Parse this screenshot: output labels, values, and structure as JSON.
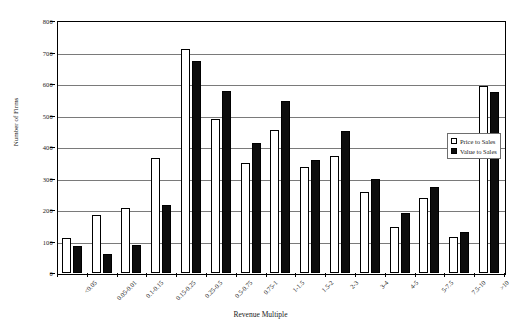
{
  "chart_data": {
    "type": "bar",
    "title": "",
    "xlabel": "Revenue Multiple",
    "ylabel": "Number of Firms",
    "ylim": [
      0,
      800
    ],
    "ytick_step": 100,
    "yticks": [
      "0",
      "100",
      "200",
      "300",
      "400",
      "500",
      "600",
      "700",
      "800"
    ],
    "grid": true,
    "legend_position": "right-middle",
    "categories": [
      "<0.05",
      "0.05-0.01",
      "0.1-0.15",
      "0.15-0.25",
      "0.25-0.5",
      "0.5-0.75",
      "0.75-1",
      "1-1.5",
      "1.5-2",
      "2-3",
      "3-4",
      "4-5",
      "5-7.5",
      "7.5-10",
      ">10"
    ],
    "series": [
      {
        "name": "Price to Sales",
        "color": "#ffffff",
        "values": [
          110,
          183,
          205,
          365,
          710,
          488,
          348,
          455,
          335,
          372,
          258,
          145,
          237,
          115,
          595
        ]
      },
      {
        "name": "Value to Sales",
        "color": "#0d0d0d",
        "values": [
          85,
          60,
          88,
          215,
          672,
          578,
          412,
          545,
          358,
          450,
          298,
          192,
          273,
          130,
          575
        ]
      }
    ]
  },
  "legend": {
    "items": [
      {
        "label": "Price to Sales"
      },
      {
        "label": "Value to Sales"
      }
    ]
  }
}
